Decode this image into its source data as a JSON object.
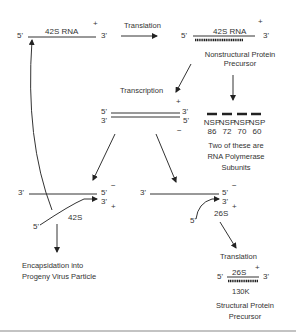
{
  "diagram": {
    "top_left_strand": {
      "five": "5'",
      "label": "42S RNA",
      "three": "3'",
      "polarity": "+"
    },
    "translation_1": "Translation",
    "top_right_strand": {
      "five": "5'",
      "label": "42S RNA",
      "three": "3'",
      "polarity": "+"
    },
    "nonstructural_precursor": [
      "Nonstructural Protein",
      "Precursor"
    ],
    "transcription": "Transcription",
    "duplex": {
      "top_five": "5'",
      "top_three": "3'",
      "top_polarity": "+",
      "bottom_three": "3'",
      "bottom_five": "5'",
      "bottom_polarity": "−"
    },
    "nsp": [
      {
        "name": "NSP",
        "num": "86"
      },
      {
        "name": "NSP",
        "num": "72"
      },
      {
        "name": "NSP",
        "num": "70"
      },
      {
        "name": "NSP",
        "num": "60"
      }
    ],
    "polymerase_note": [
      "Two of these are",
      "RNA Polymerase",
      "Subunits"
    ],
    "left_replication": {
      "template_three": "3'",
      "template_five": "5'",
      "minus": "−",
      "new_three": "3'",
      "plus": "+",
      "new_five": "5'",
      "label": "42S"
    },
    "right_replication": {
      "template_three": "3'",
      "template_five": "5'",
      "minus": "−",
      "new_three": "3'",
      "plus": "+",
      "new_five": "5'",
      "label": "26S"
    },
    "encapsidation": [
      "Encapsidation into",
      "Progeny Virus Particle"
    ],
    "translation_2": "Translation",
    "bottom_strand": {
      "five": "5'",
      "label": "26S",
      "three": "3'",
      "polarity": "+"
    },
    "structural_size": "130K",
    "structural_precursor": [
      "Structural Protein",
      "Precursor"
    ]
  }
}
